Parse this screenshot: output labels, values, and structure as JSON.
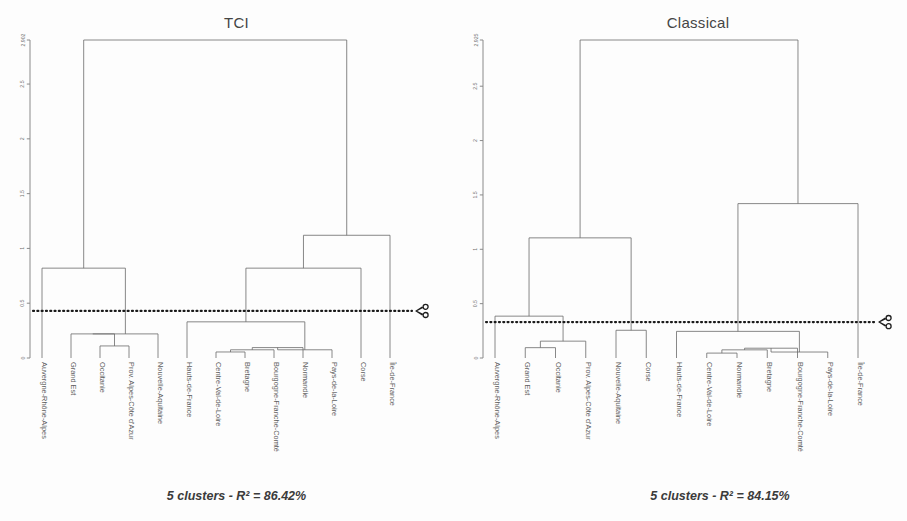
{
  "page": {
    "background": "#fdfdfd",
    "line_color": "#6a6a6a",
    "cut_color": "#1a1a1a",
    "label_color": "#5e5e5e"
  },
  "chart_data": [
    {
      "id": "tci",
      "type": "dendrogram",
      "title": "TCI",
      "caption": "5 clusters - R² = 86.42%",
      "ylabel": "",
      "xlabel": "",
      "ylim": [
        0,
        2.902
      ],
      "grid": false,
      "legend": null,
      "yticks": [
        0,
        0.5,
        1,
        1.5,
        2,
        2.5,
        2.902
      ],
      "ytick_labels": [
        "0",
        "0.5",
        "1",
        "1.5",
        "2",
        "2.5",
        "2.902"
      ],
      "cut_height": 0.43,
      "n_clusters": 5,
      "r_squared": 86.42,
      "leaves": [
        "Auvergne-Rhône-Alpes",
        "Grand Est",
        "Occitanie",
        "Prov. Alpes-Côte d'Azur",
        "Nouvelle-Aquitaine",
        "Hauts-de-France",
        "Centre-Val-de-Loire",
        "Bretagne",
        "Bourgogne-Franche-Comté",
        "Normandie",
        "Pays-de-la-Loire",
        "Corse",
        "Île-de-France"
      ],
      "merges": [
        {
          "left": "Occitanie",
          "right": "Prov. Alpes-Côte d'Azur",
          "height": 0.11
        },
        {
          "left": "Grand Est",
          "right": "m0",
          "height": 0.22
        },
        {
          "left": "Centre-Val-de-Loire",
          "right": "Bretagne",
          "height": 0.055
        },
        {
          "left": "m2",
          "right": "Bourgogne-Franche-Comté",
          "height": 0.075
        },
        {
          "left": "m3",
          "right": "Normandie",
          "height": 0.095
        },
        {
          "left": "m4",
          "right": "Pays-de-la-Loire",
          "height": 0.075
        },
        {
          "left": "m1",
          "right": "Nouvelle-Aquitaine",
          "height": 0.22
        },
        {
          "left": "Hauts-de-France",
          "right": "m5",
          "height": 0.33
        },
        {
          "left": "Auvergne-Rhône-Alpes",
          "right": "m6",
          "height": 0.82
        },
        {
          "left": "m7",
          "right": "Corse",
          "height": 0.82
        },
        {
          "left": "m9",
          "right": "Île-de-France",
          "height": 1.12
        },
        {
          "left": "m8",
          "right": "m10",
          "height": 2.902
        }
      ]
    },
    {
      "id": "classical",
      "type": "dendrogram",
      "title": "Classical",
      "caption": "5 clusters - R² = 84.15%",
      "ylabel": "",
      "xlabel": "",
      "ylim": [
        0,
        2.925
      ],
      "grid": false,
      "legend": null,
      "yticks": [
        0,
        0.5,
        1,
        1.5,
        2,
        2.5,
        2.925
      ],
      "ytick_labels": [
        "0",
        "0.5",
        "1",
        "1.5",
        "2",
        "2.5",
        "2.925"
      ],
      "cut_height": 0.33,
      "n_clusters": 5,
      "r_squared": 84.15,
      "leaves": [
        "Auvergne-Rhône-Alpes",
        "Grand Est",
        "Occitanie",
        "Prov. Alpes-Côte d'Azur",
        "Nouvelle-Aquitaine",
        "Corse",
        "Hauts-de-France",
        "Centre-Val-de-Loire",
        "Normandie",
        "Bretagne",
        "Bourgogne-Franche-Comté",
        "Pays-de-la-Loire",
        "Île-de-France"
      ],
      "merges": [
        {
          "left": "Grand Est",
          "right": "Occitanie",
          "height": 0.095
        },
        {
          "left": "m0",
          "right": "Prov. Alpes-Côte d'Azur",
          "height": 0.155
        },
        {
          "left": "Auvergne-Rhône-Alpes",
          "right": "m1",
          "height": 0.385
        },
        {
          "left": "Nouvelle-Aquitaine",
          "right": "Corse",
          "height": 0.255
        },
        {
          "left": "m2",
          "right": "m3",
          "height": 1.105
        },
        {
          "left": "Centre-Val-de-Loire",
          "right": "Normandie",
          "height": 0.045
        },
        {
          "left": "m5",
          "right": "Bretagne",
          "height": 0.075
        },
        {
          "left": "m6",
          "right": "Bourgogne-Franche-Comté",
          "height": 0.09
        },
        {
          "left": "m7",
          "right": "Pays-de-la-Loire",
          "height": 0.055
        },
        {
          "left": "Hauts-de-France",
          "right": "m8",
          "height": 0.245
        },
        {
          "left": "m9",
          "right": "Île-de-France",
          "height": 1.42
        },
        {
          "left": "m4",
          "right": "m10",
          "height": 2.925
        }
      ]
    }
  ],
  "icons": {
    "scissors": "scissors-icon"
  }
}
